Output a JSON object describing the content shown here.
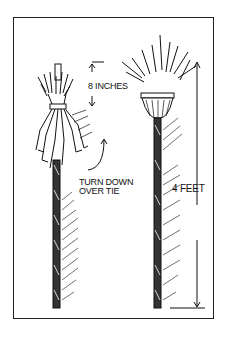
{
  "illustration": {
    "subject": "two mops made of rag strips on poles",
    "labels": {
      "height_label": "8 INCHES",
      "instruction_line1": "TURN DOWN",
      "instruction_line2": "OVER TIE",
      "length_label": "4 FEET"
    },
    "colors": {
      "ink": "#111111",
      "paper": "#ffffff"
    }
  }
}
